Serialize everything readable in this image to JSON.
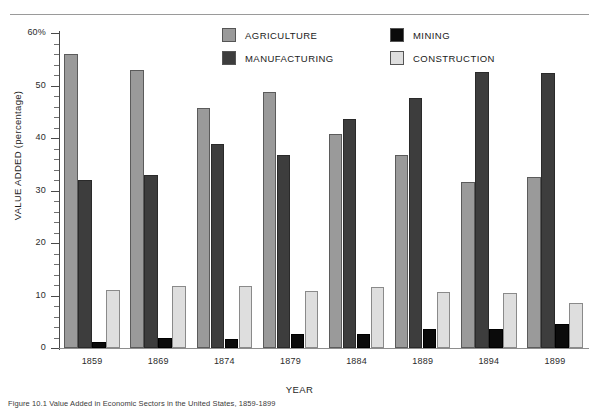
{
  "axis": {
    "y_title": "VALUE ADDED (percentage)",
    "x_title": "YEAR",
    "y_ticks": [
      "60%",
      "50",
      "40",
      "30",
      "20",
      "10",
      "0"
    ]
  },
  "legend": {
    "items": [
      {
        "label": "AGRICULTURE",
        "color": "#9a9a9a",
        "key": "agriculture"
      },
      {
        "label": "MANUFACTURING",
        "color": "#3d3d3d",
        "key": "manufacturing"
      },
      {
        "label": "MINING",
        "color": "#0b0b0b",
        "key": "mining"
      },
      {
        "label": "CONSTRUCTION",
        "color": "#dedede",
        "key": "construction"
      }
    ]
  },
  "caption": {
    "text": "Figure 10.1 Value Added in Economic Sectors in the United States, 1859-1899"
  },
  "chart_data": {
    "type": "bar",
    "title": "",
    "xlabel": "YEAR",
    "ylabel": "VALUE ADDED (percentage)",
    "ylim": [
      0,
      60
    ],
    "ytick_step": 10,
    "minor_ticks": true,
    "grid": false,
    "legend_position": "top-center",
    "categories": [
      "1859",
      "1869",
      "1874",
      "1879",
      "1884",
      "1889",
      "1894",
      "1899"
    ],
    "series": [
      {
        "name": "AGRICULTURE",
        "color": "#9a9a9a",
        "values": [
          56.0,
          53.0,
          45.8,
          48.8,
          40.8,
          36.7,
          31.7,
          32.5
        ]
      },
      {
        "name": "MANUFACTURING",
        "color": "#3d3d3d",
        "values": [
          32.0,
          33.0,
          38.8,
          36.8,
          43.7,
          47.7,
          52.5,
          52.4
        ]
      },
      {
        "name": "MINING",
        "color": "#0b0b0b",
        "values": [
          1.1,
          2.0,
          1.8,
          2.7,
          2.7,
          3.7,
          3.6,
          4.5
        ]
      },
      {
        "name": "CONSTRUCTION",
        "color": "#dedede",
        "values": [
          11.0,
          11.9,
          11.9,
          10.8,
          11.7,
          10.7,
          10.5,
          8.5
        ]
      }
    ]
  }
}
